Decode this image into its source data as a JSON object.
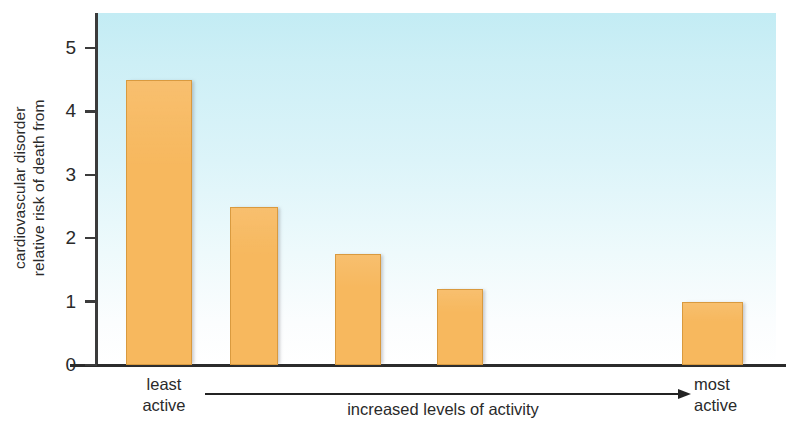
{
  "chart_data": {
    "type": "bar",
    "title": "",
    "subtitle": "",
    "categories": [
      "least active",
      "",
      "",
      "",
      "most active"
    ],
    "values": [
      4.5,
      2.5,
      1.75,
      1.2,
      1.0
    ],
    "series": [
      {
        "name": "relative risk of death from cardiovascular disorder",
        "values": [
          4.5,
          2.5,
          1.75,
          1.2,
          1.0
        ]
      }
    ],
    "xlabel": "increased levels of activity",
    "ylabel": "relative risk of death from cardiovascular disorder",
    "ylim": [
      0,
      5.4
    ],
    "yticks": [
      0,
      1,
      2,
      3,
      4,
      5
    ],
    "ytick_labels": [
      "0",
      "1",
      "2",
      "3",
      "4",
      "5"
    ],
    "grid": false,
    "legend": "none",
    "bar_color": "#f7b85e",
    "bar_border_color": "#d99a3f",
    "plot_background_top_color": "#c3ecf4",
    "plot_background_bottom_color": "#ffffff",
    "axis_color": "#2b2b2b",
    "annotations": [
      {
        "name": "left-endpoint",
        "text": "least active"
      },
      {
        "name": "arrow-caption",
        "text": "increased levels of activity"
      },
      {
        "name": "right-endpoint",
        "text": "most active"
      }
    ]
  },
  "axis": {
    "y_title_line1": "relative risk of death from",
    "y_title_line2": "cardiovascular disorder"
  },
  "xaxis": {
    "least_line1": "least",
    "least_line2": "active",
    "most_line1": "most",
    "most_line2": "active",
    "caption": "increased levels of activity"
  }
}
